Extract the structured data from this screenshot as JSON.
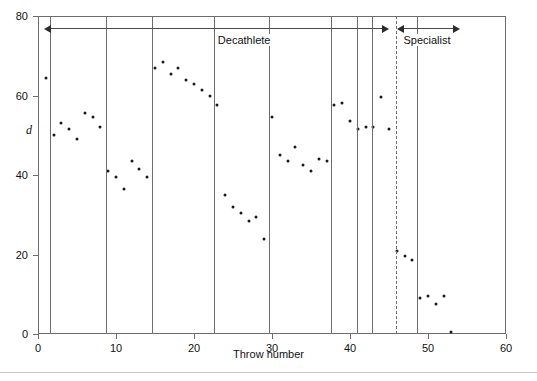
{
  "chart_data": {
    "type": "scatter",
    "title": "",
    "xlabel": "Throw number",
    "ylabel": "d",
    "xlim": [
      0,
      60
    ],
    "ylim": [
      0,
      80
    ],
    "xticks": [
      0,
      10,
      20,
      30,
      40,
      50,
      60
    ],
    "yticks": [
      0,
      20,
      40,
      60,
      80
    ],
    "grid": false,
    "legend": "none",
    "series": [
      {
        "name": "d",
        "x": [
          1,
          2,
          3,
          4,
          5,
          6,
          7,
          8,
          9,
          10,
          11,
          12,
          13,
          14,
          15,
          16,
          17,
          18,
          19,
          20,
          21,
          22,
          23,
          24,
          25,
          26,
          27,
          28,
          29,
          30,
          31,
          32,
          33,
          34,
          35,
          36,
          37,
          38,
          39,
          40,
          41,
          42,
          43,
          44,
          45,
          46,
          47,
          48,
          49,
          50,
          51,
          52,
          53
        ],
        "y": [
          64.5,
          50.0,
          53.0,
          51.5,
          49.0,
          55.5,
          54.5,
          52.0,
          41.0,
          39.5,
          36.5,
          43.5,
          41.5,
          39.5,
          67.0,
          68.5,
          65.5,
          67.0,
          64.0,
          63.0,
          61.5,
          60.0,
          57.5,
          35.0,
          32.0,
          30.5,
          28.5,
          29.5,
          24.0,
          54.5,
          45.0,
          43.5,
          47.0,
          42.5,
          41.0,
          44.0,
          43.5,
          57.5,
          58.0,
          53.5,
          51.5,
          52.0,
          52.0,
          59.5,
          51.5,
          21.0,
          19.5,
          18.5,
          9.0,
          9.5,
          7.5,
          9.5,
          0.5
        ]
      }
    ],
    "segment_dividers": [
      1.5,
      8.7,
      14.6,
      22.6,
      29.6,
      37.6,
      40.9,
      42.8,
      48.6
    ],
    "dashed_divider": 45.9,
    "annotations": [
      {
        "label": "Decathlete",
        "from": 0.8,
        "to": 45.0,
        "style": "double-arrow"
      },
      {
        "label": "Specialist",
        "from": 46.0,
        "to": 54.1,
        "style": "double-arrow"
      }
    ]
  },
  "axis": {
    "x_tick_labels": [
      "0",
      "10",
      "20",
      "30",
      "40",
      "50",
      "60"
    ],
    "y_tick_labels": [
      "0",
      "20",
      "40",
      "60",
      "80"
    ],
    "x_title": "Throw number",
    "y_title": "d"
  },
  "annotations": {
    "decathlete_label": "Decathlete",
    "specialist_label": "Specialist"
  },
  "colors": {
    "axis": "#6d6d6d",
    "point": "#1a1a1a",
    "arrow": "#2b2b2b",
    "rule": "#c8c8c8",
    "background": "#ffffff"
  }
}
